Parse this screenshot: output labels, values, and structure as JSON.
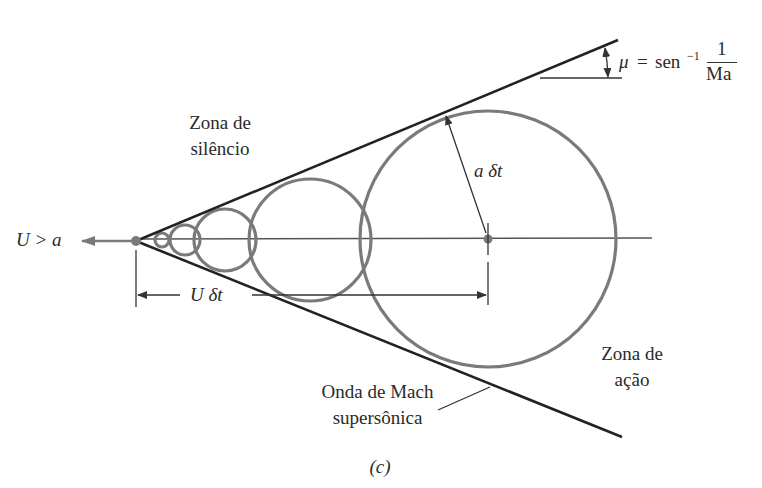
{
  "figure": {
    "caption": "(c)",
    "colors": {
      "background": "#ffffff",
      "wave_line": "#222222",
      "circles": "#7a7a7a",
      "axis": "#555555",
      "text": "#2a2a2a"
    }
  },
  "labels": {
    "velocity": "U > a",
    "silence_zone_line1": "Zona de",
    "silence_zone_line2": "silêncio",
    "action_zone_line1": "Zona de",
    "action_zone_line2": "ação",
    "mach_wave_line1": "Onda de Mach",
    "mach_wave_line2": "supersônica",
    "radius": "a δt",
    "distance": "U δt",
    "mach_angle": {
      "mu": "μ",
      "equals": "=",
      "func": "sen",
      "exp": "−1",
      "numerator": "1",
      "denominator": "Ma"
    }
  },
  "geometry": {
    "apex": [
      136,
      241
    ],
    "circles": [
      {
        "cx": 488,
        "cy": 239,
        "r": 128
      },
      {
        "cx": 310,
        "cy": 240,
        "r": 61
      },
      {
        "cx": 225,
        "cy": 240,
        "r": 31
      },
      {
        "cx": 185,
        "cy": 240,
        "r": 15
      },
      {
        "cx": 162,
        "cy": 240,
        "r": 7
      }
    ]
  }
}
